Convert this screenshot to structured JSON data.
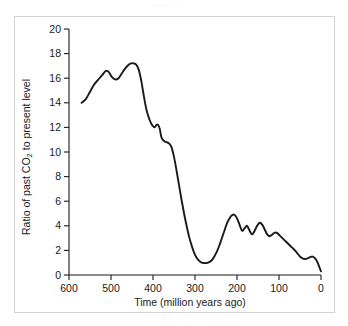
{
  "figure": {
    "background_color": "#ffffff",
    "frame_color": "#d2d2d4",
    "curve_color": "#1a1a1a",
    "axis_color": "#1a1a1a",
    "tick_label_color": "#1a1a1a",
    "top_artifact_text": "........ ... ..."
  },
  "chart_data": {
    "type": "line",
    "title": "",
    "xlabel": "Time (million years ago)",
    "ylabel": "Ratio of past CO2 to present level",
    "ylabel_parts": {
      "before": "Ratio of past CO",
      "subscript": "2",
      "after": " to present level"
    },
    "xlim": [
      600,
      0
    ],
    "ylim": [
      0,
      20
    ],
    "x_reversed": true,
    "grid": false,
    "legend": "none",
    "xticks": [
      600,
      500,
      400,
      300,
      200,
      100,
      0
    ],
    "xtick_labels": [
      "600",
      "500",
      "400",
      "300",
      "200",
      "100",
      "0"
    ],
    "yticks": [
      0,
      2,
      4,
      6,
      8,
      10,
      12,
      14,
      16,
      18,
      20
    ],
    "ytick_labels": [
      "0",
      "2",
      "4",
      "6",
      "8",
      "10",
      "12",
      "14",
      "16",
      "18",
      "20"
    ],
    "series": [
      {
        "name": "Ratio of past CO2 to present level",
        "x": [
          570,
          560,
          550,
          540,
          530,
          520,
          512,
          505,
          498,
          490,
          482,
          474,
          466,
          458,
          452,
          446,
          440,
          434,
          428,
          424,
          420,
          416,
          412,
          408,
          404,
          400,
          396,
          392,
          388,
          384,
          380,
          374,
          368,
          362,
          356,
          350,
          344,
          338,
          332,
          326,
          320,
          314,
          308,
          302,
          296,
          290,
          284,
          278,
          272,
          266,
          260,
          254,
          248,
          242,
          236,
          230,
          224,
          218,
          212,
          206,
          200,
          194,
          188,
          182,
          176,
          170,
          164,
          158,
          152,
          146,
          140,
          134,
          128,
          122,
          116,
          110,
          104,
          98,
          92,
          86,
          80,
          74,
          68,
          62,
          56,
          50,
          44,
          38,
          32,
          26,
          20,
          14,
          8,
          4,
          0
        ],
        "y": [
          14.0,
          14.3,
          14.9,
          15.5,
          15.9,
          16.3,
          16.6,
          16.5,
          16.1,
          15.9,
          16.0,
          16.4,
          16.8,
          17.1,
          17.2,
          17.2,
          17.1,
          16.7,
          15.8,
          15.0,
          14.2,
          13.5,
          13.0,
          12.6,
          12.3,
          12.1,
          12.0,
          12.2,
          12.2,
          11.9,
          11.2,
          10.9,
          10.8,
          10.7,
          10.4,
          9.6,
          8.5,
          7.3,
          6.1,
          5.0,
          4.0,
          3.1,
          2.4,
          1.8,
          1.4,
          1.15,
          1.0,
          0.97,
          0.98,
          1.05,
          1.2,
          1.5,
          1.9,
          2.4,
          3.0,
          3.6,
          4.2,
          4.6,
          4.85,
          4.9,
          4.6,
          4.1,
          3.6,
          3.8,
          4.0,
          3.6,
          3.3,
          3.6,
          4.0,
          4.25,
          4.1,
          3.7,
          3.3,
          3.15,
          3.3,
          3.45,
          3.4,
          3.2,
          3.0,
          2.8,
          2.6,
          2.4,
          2.2,
          2.0,
          1.75,
          1.5,
          1.35,
          1.3,
          1.35,
          1.45,
          1.5,
          1.35,
          1.0,
          0.65,
          0.3
        ]
      }
    ],
    "annotations": {
      "start_value": 14.0,
      "max_value": 17.2,
      "max_at_ma": 452,
      "min_value": 0.97,
      "min_at_ma": 278,
      "end_value": 0.3,
      "secondary_peak_value": 4.9,
      "secondary_peak_at_ma": 206
    }
  }
}
